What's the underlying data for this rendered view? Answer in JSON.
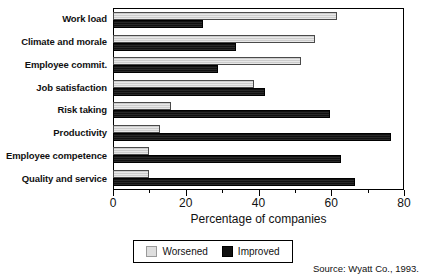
{
  "chart_data": {
    "type": "bar",
    "orientation": "horizontal",
    "title": "",
    "xlabel": "Percentage of companies",
    "ylabel": "",
    "xlim": [
      0,
      80
    ],
    "xticks": [
      0,
      20,
      40,
      60,
      80
    ],
    "xtick_labels": [
      "0",
      "20",
      "40",
      "60",
      "80"
    ],
    "minor_tick_step": 10,
    "grid": false,
    "legend_position": "bottom-center",
    "categories": [
      "Work load",
      "Climate and morale",
      "Employee commit.",
      "Job satisfaction",
      "Risk taking",
      "Productivity",
      "Employee competence",
      "Quality and service"
    ],
    "series": [
      {
        "name": "Worsened",
        "color": "#cccccc",
        "values": [
          62,
          56,
          52,
          39,
          16,
          13,
          10,
          10
        ]
      },
      {
        "name": "Improved",
        "color": "#111111",
        "values": [
          25,
          34,
          29,
          42,
          60,
          77,
          63,
          67
        ]
      }
    ]
  },
  "legend": {
    "items": [
      {
        "label": "Worsened",
        "swatch": "worsened-swatch"
      },
      {
        "label": "Improved",
        "swatch": "improved-swatch"
      }
    ]
  },
  "source": "Source: Wyatt Co., 1993."
}
